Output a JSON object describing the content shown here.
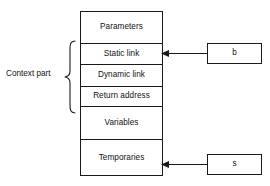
{
  "diagram": {
    "stack_frame": {
      "name": "activation-record",
      "rows": [
        {
          "id": "parameters",
          "label": "Parameters"
        },
        {
          "id": "static-link",
          "label": "Static link"
        },
        {
          "id": "dynamic-link",
          "label": "Dynamic link"
        },
        {
          "id": "return-address",
          "label": "Return address"
        },
        {
          "id": "variables",
          "label": "Variables"
        },
        {
          "id": "temporaries",
          "label": "Temporaries"
        }
      ]
    },
    "context_bracket": {
      "label": "Context part",
      "spans_rows": [
        "static-link",
        "dynamic-link",
        "return-address"
      ]
    },
    "pointers": [
      {
        "id": "b",
        "label": "b",
        "points_to": "static-link"
      },
      {
        "id": "s",
        "label": "s",
        "points_to": "temporaries"
      }
    ],
    "colors": {
      "stroke": "#1a1a1a",
      "text": "#111111",
      "background": "#ffffff"
    }
  }
}
